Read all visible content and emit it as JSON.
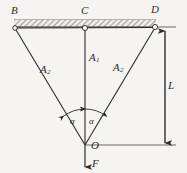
{
  "figure": {
    "type": "engineering-free-body-diagram",
    "background_color": "#f6f4f1",
    "line_color": "#2b2b2b",
    "hatch_color": "#8a8a8a"
  },
  "labels": {
    "node_b": "B",
    "node_c": "C",
    "node_d": "D",
    "node_o": "O",
    "cable_a1": "A",
    "cable_a1_sub": "1",
    "cable_a2_left": "A",
    "cable_a2_left_sub": "2",
    "cable_a2_right": "A",
    "cable_a2_right_sub": "2",
    "angle_left": "α",
    "angle_right": "α",
    "dimension_l": "L",
    "force_f": "F"
  },
  "geometry": {
    "ceiling_y": 27,
    "node_b": {
      "x": 15,
      "y": 28
    },
    "node_c": {
      "x": 85,
      "y": 28
    },
    "node_d": {
      "x": 155,
      "y": 27
    },
    "node_o": {
      "x": 85,
      "y": 145
    },
    "dimension_line_x": 165,
    "dimension_top_y": 30,
    "dimension_bottom_y": 145,
    "force_arrow_tip": {
      "x": 85,
      "y": 168
    },
    "angle_arc_radius": 36
  },
  "icons": {
    "force_arrow": "arrow-down-icon",
    "dimension_arrow_top": "arrow-up-icon",
    "dimension_arrow_bottom": "arrow-down-icon",
    "angle_arc": "arc-double-arrow-icon",
    "pin_node": "circle-node-icon",
    "ceiling": "hatched-ceiling-icon"
  }
}
